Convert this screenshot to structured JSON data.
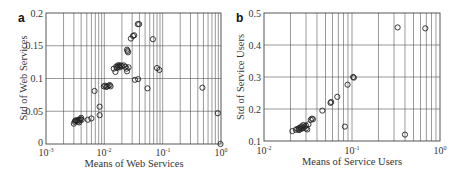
{
  "chart_data": [
    {
      "panel": "a",
      "type": "scatter",
      "title": "",
      "xlabel": "Means of Web Services",
      "ylabel": "Std of Web Services",
      "xscale": "log",
      "xlim": [
        0.001,
        1
      ],
      "ylim": [
        0,
        0.2
      ],
      "xticks": [
        "10^-3",
        "10^-2",
        "10^-1",
        "10^0"
      ],
      "yticks": [
        "0",
        "0.05",
        "0.1",
        "0.15",
        "0.2"
      ],
      "grid": true,
      "marker": "open-circle",
      "points": [
        [
          0.003,
          0.031
        ],
        [
          0.0031,
          0.034
        ],
        [
          0.0032,
          0.036
        ],
        [
          0.0033,
          0.035
        ],
        [
          0.0034,
          0.036
        ],
        [
          0.0035,
          0.034
        ],
        [
          0.0036,
          0.037
        ],
        [
          0.0037,
          0.033
        ],
        [
          0.0038,
          0.036
        ],
        [
          0.0039,
          0.038
        ],
        [
          0.004,
          0.04
        ],
        [
          0.0041,
          0.037
        ],
        [
          0.0052,
          0.037
        ],
        [
          0.006,
          0.039
        ],
        [
          0.0068,
          0.081
        ],
        [
          0.0083,
          0.057
        ],
        [
          0.0083,
          0.044
        ],
        [
          0.0098,
          0.088
        ],
        [
          0.0103,
          0.089
        ],
        [
          0.0108,
          0.087
        ],
        [
          0.0112,
          0.088
        ],
        [
          0.0118,
          0.089
        ],
        [
          0.0124,
          0.09
        ],
        [
          0.0128,
          0.088
        ],
        [
          0.0145,
          0.115
        ],
        [
          0.0155,
          0.11
        ],
        [
          0.016,
          0.118
        ],
        [
          0.0165,
          0.116
        ],
        [
          0.017,
          0.12
        ],
        [
          0.0175,
          0.118
        ],
        [
          0.018,
          0.12
        ],
        [
          0.0185,
          0.117
        ],
        [
          0.019,
          0.12
        ],
        [
          0.02,
          0.119
        ],
        [
          0.0215,
          0.12
        ],
        [
          0.023,
          0.118
        ],
        [
          0.024,
          0.115
        ],
        [
          0.0245,
          0.111
        ],
        [
          0.026,
          0.117
        ],
        [
          0.0245,
          0.144
        ],
        [
          0.025,
          0.142
        ],
        [
          0.0255,
          0.14
        ],
        [
          0.0285,
          0.161
        ],
        [
          0.031,
          0.165
        ],
        [
          0.0325,
          0.166
        ],
        [
          0.0375,
          0.183
        ],
        [
          0.0395,
          0.183
        ],
        [
          0.0335,
          0.098
        ],
        [
          0.038,
          0.099
        ],
        [
          0.055,
          0.085
        ],
        [
          0.068,
          0.16
        ],
        [
          0.08,
          0.116
        ],
        [
          0.088,
          0.113
        ],
        [
          0.48,
          0.086
        ],
        [
          0.88,
          0.047
        ],
        [
          0.98,
          0.0
        ]
      ]
    },
    {
      "panel": "b",
      "type": "scatter",
      "title": "",
      "xlabel": "Means of Service Users",
      "ylabel": "Std of Service Users",
      "xscale": "log",
      "xlim": [
        0.01,
        1
      ],
      "ylim": [
        0.1,
        0.5
      ],
      "xticks": [
        "10^-2",
        "10^-1",
        "10^0"
      ],
      "yticks": [
        "0.1",
        "0.2",
        "0.3",
        "0.4",
        "0.5"
      ],
      "grid": true,
      "marker": "open-circle",
      "points": [
        [
          0.021,
          0.131
        ],
        [
          0.023,
          0.135
        ],
        [
          0.024,
          0.138
        ],
        [
          0.025,
          0.14
        ],
        [
          0.025,
          0.134
        ],
        [
          0.026,
          0.143
        ],
        [
          0.026,
          0.137
        ],
        [
          0.027,
          0.146
        ],
        [
          0.027,
          0.139
        ],
        [
          0.028,
          0.142
        ],
        [
          0.028,
          0.15
        ],
        [
          0.029,
          0.145
        ],
        [
          0.03,
          0.139
        ],
        [
          0.03,
          0.148
        ],
        [
          0.031,
          0.136
        ],
        [
          0.032,
          0.152
        ],
        [
          0.034,
          0.166
        ],
        [
          0.035,
          0.17
        ],
        [
          0.036,
          0.168
        ],
        [
          0.046,
          0.195
        ],
        [
          0.057,
          0.219
        ],
        [
          0.058,
          0.222
        ],
        [
          0.068,
          0.238
        ],
        [
          0.083,
          0.145
        ],
        [
          0.089,
          0.276
        ],
        [
          0.103,
          0.3
        ],
        [
          0.105,
          0.298
        ],
        [
          0.33,
          0.455
        ],
        [
          0.4,
          0.12
        ],
        [
          0.68,
          0.452
        ]
      ]
    }
  ],
  "panels": {
    "a": {
      "label": "a",
      "xlabel": "Means of Web Services",
      "ylabel": "Std of Web Services",
      "yticks": [
        "0.2",
        "0.15",
        "0.1",
        "0.05",
        "0"
      ],
      "xticks_base": [
        "10",
        "10",
        "10",
        "10"
      ],
      "xticks_exp": [
        "-3",
        "-2",
        "-1",
        "0"
      ]
    },
    "b": {
      "label": "b",
      "xlabel": "Means of Service Users",
      "ylabel": "Std of Service Users",
      "yticks": [
        "0.5",
        "0.4",
        "0.3",
        "0.2",
        "0.1"
      ],
      "xticks_base": [
        "10",
        "10",
        "10"
      ],
      "xticks_exp": [
        "-2",
        "-1",
        "0"
      ]
    }
  }
}
